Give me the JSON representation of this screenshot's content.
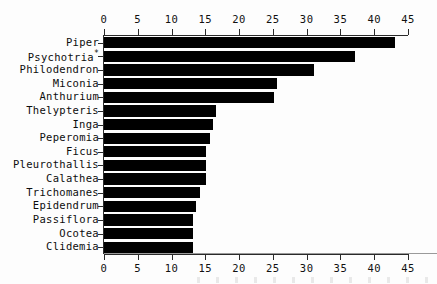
{
  "chart_data": {
    "type": "bar",
    "orientation": "horizontal",
    "title": "",
    "xlabel": "",
    "ylabel": "",
    "xlim": [
      0,
      45
    ],
    "xticks": [
      0,
      5,
      10,
      15,
      20,
      25,
      30,
      35,
      40,
      45
    ],
    "tick_labels": [
      "0",
      "5",
      "10",
      "15",
      "20",
      "25",
      "30",
      "35",
      "40",
      "45"
    ],
    "grid": false,
    "legend": null,
    "axis_top": true,
    "axis_bottom": true,
    "bar_color": "#000000",
    "categories": [
      "Piper",
      "Psychotria*",
      "Philodendron",
      "Miconia",
      "Anthurium",
      "Thelypteris",
      "Inga",
      "Peperomia",
      "Ficus",
      "Pleurothallis",
      "Calathea",
      "Trichomanes",
      "Epidendrum",
      "Passiflora",
      "Ocotea",
      "Clidemia"
    ],
    "values": [
      43,
      37,
      31,
      25.5,
      25,
      16.5,
      16,
      15.5,
      15,
      15,
      15,
      14,
      13.5,
      13,
      13,
      13
    ],
    "series": [
      {
        "name": "Number of species",
        "values": [
          43,
          37,
          31,
          25.5,
          25,
          16.5,
          16,
          15.5,
          15,
          15,
          15,
          14,
          13.5,
          13,
          13,
          13
        ]
      }
    ]
  }
}
